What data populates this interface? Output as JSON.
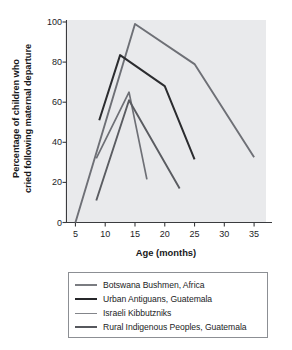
{
  "chart_data": {
    "type": "line",
    "title": "",
    "xlabel": "Age (months)",
    "ylabel": "Percentage of children who cried following maternal departure",
    "ylabel_line1": "Percentage of children who",
    "ylabel_line2": "cried following maternal departure",
    "xlim": [
      3.5,
      37
    ],
    "ylim": [
      0,
      100
    ],
    "xticks": [
      5,
      10,
      15,
      20,
      25,
      30,
      35
    ],
    "yticks": [
      0,
      20,
      40,
      60,
      80,
      100
    ],
    "grid": false,
    "legend_position": "below-plot",
    "plot_bg": "#e9eaec",
    "series": [
      {
        "name": "Botswana Bushmen, Africa",
        "color": "#6e7076",
        "width": 1.9,
        "x": [
          5,
          15,
          25,
          35
        ],
        "y": [
          0,
          99,
          79,
          32.5
        ]
      },
      {
        "name": "Urban Antiguans, Guatemala",
        "color": "#2b2c2f",
        "width": 2.0,
        "x": [
          9,
          12.5,
          20,
          25
        ],
        "y": [
          51,
          83.5,
          68,
          31.5
        ]
      },
      {
        "name": "Israeli Kibbutzniks",
        "color": "#6e7076",
        "width": 1.7,
        "x": [
          8.5,
          14,
          17
        ],
        "y": [
          32,
          65,
          21.5
        ]
      },
      {
        "name": "Rural Indigenous Peoples, Guatemala",
        "color": "#5a5c61",
        "width": 1.9,
        "x": [
          8.5,
          14,
          22.5
        ],
        "y": [
          11,
          61,
          17
        ]
      }
    ]
  },
  "legend": {
    "items": [
      {
        "label": "Botswana Bushmen, Africa",
        "color": "#7a7c81",
        "width": 2
      },
      {
        "label": "Urban Antiguans, Guatemala",
        "color": "#26272a",
        "width": 2.6
      },
      {
        "label": "Israeli Kibbutzniks",
        "color": "#83858a",
        "width": 1.8
      },
      {
        "label": "Rural Indigenous Peoples, Guatemala",
        "color": "#56585d",
        "width": 2.4
      }
    ]
  }
}
